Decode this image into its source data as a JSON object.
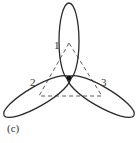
{
  "figure": {
    "caption": "(c)",
    "labels": [
      "1",
      "2",
      "3"
    ],
    "colors": {
      "curve": "#2a2a2a",
      "triangle": "#4a4a4a",
      "text": "#333333",
      "background": "#ffffff"
    },
    "center": [
      69,
      78
    ],
    "lobes": [
      {
        "label": "1",
        "direction": "up",
        "tip": [
          69,
          3
        ]
      },
      {
        "label": "2",
        "direction": "lower-left",
        "tip": [
          9,
          112
        ]
      },
      {
        "label": "3",
        "direction": "lower-right",
        "tip": [
          133,
          112
        ]
      }
    ],
    "dashed_triangle": {
      "apex": [
        69,
        43
      ],
      "base_left": [
        39,
        96
      ],
      "base_right": [
        102,
        96
      ]
    }
  }
}
